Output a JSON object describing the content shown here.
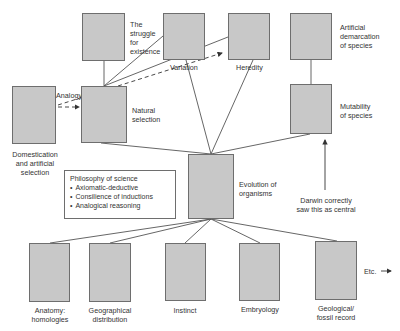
{
  "diagram": {
    "nodes": {
      "struggle": {
        "label_lines": [
          "The",
          "struggle",
          "for",
          "existence"
        ]
      },
      "variation": {
        "label": "Variation"
      },
      "heredity": {
        "label": "Heredity"
      },
      "artificial_demarcation": {
        "label_lines": [
          "Artificial",
          "demarcation",
          "of species"
        ]
      },
      "domestication": {
        "label_lines": [
          "Domestication",
          "and artificial",
          "selection"
        ]
      },
      "natural_selection": {
        "label_lines": [
          "Natural",
          "selection"
        ]
      },
      "mutability": {
        "label_lines": [
          "Mutability",
          "of species"
        ]
      },
      "evolution": {
        "label_lines": [
          "Evolution of",
          "organisms"
        ]
      },
      "anatomy": {
        "label_lines": [
          "Anatomy:",
          "homologies"
        ]
      },
      "geographical": {
        "label_lines": [
          "Geographical",
          "distribution"
        ]
      },
      "instinct": {
        "label": "Instinct"
      },
      "embryology": {
        "label": "Embryology"
      },
      "geological": {
        "label_lines": [
          "Geological/",
          "fossil record"
        ]
      }
    },
    "analogy_label": "Analogy",
    "philosophy": {
      "title": "Philosophy of science",
      "items": [
        "Axiomatic-deductive",
        "Consilience of inductions",
        "Analogical reasoning"
      ]
    },
    "darwin_note_lines": [
      "Darwin correctly",
      "saw this as central"
    ],
    "etc_label": "Etc.",
    "colors": {
      "box_fill": "#c8c8c8",
      "box_border": "#6e6e6e",
      "line": "#555555",
      "text": "#333333"
    }
  }
}
